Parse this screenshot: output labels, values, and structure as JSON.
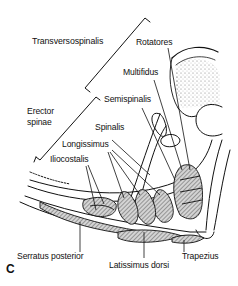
{
  "figure": {
    "panel_letter": "C",
    "groups": [
      {
        "name": "Transversospinalis",
        "members": [
          "Rotatores",
          "Multifidus",
          "Semispinalis"
        ]
      },
      {
        "name": "Erector spinae",
        "members": [
          "Spinalis",
          "Longissimus",
          "Iliocostalis"
        ]
      }
    ],
    "labels": {
      "transversospinalis": "Transversospinalis",
      "rotatores": "Rotatores",
      "multifidus": "Multifidus",
      "semispinalis": "Semispinalis",
      "erector_line1": "Erector",
      "erector_line2": "spinae",
      "spinalis": "Spinalis",
      "longissimus": "Longissimus",
      "iliocostalis": "Iliocostalis",
      "serratus_posterior": "Serratus posterior",
      "latissimus_dorsi": "Latissimus dorsi",
      "trapezius": "Trapezius"
    },
    "colors": {
      "ink": "#111111",
      "hatch_fill": "#9a9a9a",
      "background": "#ffffff"
    }
  }
}
